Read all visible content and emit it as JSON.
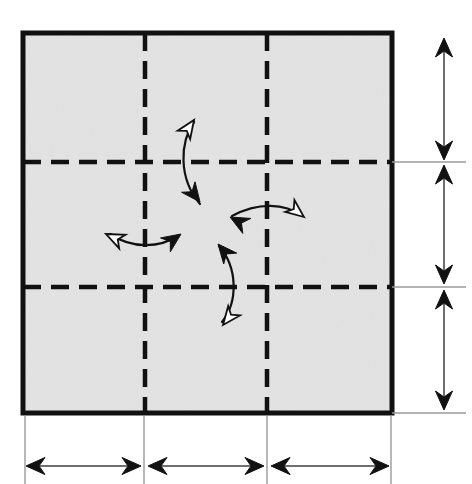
{
  "figure": {
    "type": "technical-diagram",
    "background_color": "#ffffff"
  },
  "colors": {
    "panel_fill": "#e3e3e3",
    "border_stroke": "#111111",
    "dashed_stroke": "#111111",
    "extension_line": "#9a9a9a",
    "arrow_solid": "#111111",
    "arrow_hollow_fill": "#ffffff",
    "arrow_hollow_stroke": "#111111",
    "dimension_line": "#6f6f6f"
  },
  "square": {
    "name": "main-panel",
    "x": 23,
    "y": 33,
    "width": 369,
    "height": 380,
    "stroke_width": 5,
    "fill": "#e3e3e3"
  },
  "grid": {
    "dash_pattern": "18 10",
    "stroke_width": 4.5,
    "vertical_lines": [
      {
        "name": "grid-line-vertical-1",
        "x": 145,
        "y1": 33,
        "y2": 413
      },
      {
        "name": "grid-line-vertical-2",
        "x": 267,
        "y1": 33,
        "y2": 413
      }
    ],
    "horizontal_lines": [
      {
        "name": "grid-line-horizontal-1",
        "y": 162,
        "x1": 23,
        "x2": 392
      },
      {
        "name": "grid-line-horizontal-2",
        "y": 287,
        "x1": 23,
        "x2": 392
      }
    ]
  },
  "rotation_arrows": [
    {
      "name": "rotation-arrow-top",
      "description": "curved double-headed arrow above center, hollow head points up, solid head points down",
      "path": "M 200 204 C 178 178 180 142 194 122",
      "head_start": {
        "style": "solid",
        "cx": 200,
        "cy": 202,
        "angle": 52
      },
      "head_end": {
        "style": "hollow",
        "cx": 194,
        "cy": 120,
        "angle": -56
      }
    },
    {
      "name": "rotation-arrow-right",
      "description": "curved double-headed arrow right of center, solid head points left, hollow head points right",
      "path": "M 232 216 C 258 202 285 203 302 216",
      "head_start": {
        "style": "solid",
        "cx": 230,
        "cy": 217,
        "angle": 208
      },
      "head_end": {
        "style": "hollow",
        "cx": 304,
        "cy": 217,
        "angle": 38
      }
    },
    {
      "name": "rotation-arrow-bottom",
      "description": "curved double-headed arrow below center, solid head points up, hollow head points down",
      "path": "M 219 246 C 238 268 238 302 222 322",
      "head_start": {
        "style": "solid",
        "cx": 218,
        "cy": 244,
        "angle": -130
      },
      "head_end": {
        "style": "hollow",
        "cx": 223,
        "cy": 325,
        "angle": 128
      }
    },
    {
      "name": "rotation-arrow-left",
      "description": "curved double-headed arrow left of center, hollow head points left, solid head points right",
      "path": "M 110 234 C 132 249 160 248 177 236",
      "head_start": {
        "style": "hollow",
        "cx": 106,
        "cy": 234,
        "angle": 205
      },
      "head_end": {
        "style": "solid",
        "cx": 181,
        "cy": 234,
        "angle": -35
      }
    }
  ],
  "vertical_dimensions": {
    "name": "vertical-dimension-stack",
    "axis_x": 444,
    "segments": [
      {
        "name": "vertical-dimension-segment-1",
        "y_top": 38,
        "y_bottom": 160,
        "label": ""
      },
      {
        "name": "vertical-dimension-segment-2",
        "y_top": 165,
        "y_bottom": 284,
        "label": ""
      },
      {
        "name": "vertical-dimension-segment-3",
        "y_top": 290,
        "y_bottom": 410,
        "label": ""
      }
    ],
    "extension_lines": [
      {
        "name": "vertical-extension-line-top",
        "y": 162,
        "x1": 392,
        "x2": 466
      },
      {
        "name": "vertical-extension-line-middle",
        "y": 287,
        "x1": 392,
        "x2": 466
      },
      {
        "name": "vertical-extension-line-bottom",
        "y": 413,
        "x1": 392,
        "x2": 466
      }
    ]
  },
  "horizontal_dimensions": {
    "name": "horizontal-dimension-stack",
    "axis_y": 466,
    "segments": [
      {
        "name": "horizontal-dimension-segment-1",
        "x_left": 26,
        "x_right": 141,
        "label": ""
      },
      {
        "name": "horizontal-dimension-segment-2",
        "x_left": 148,
        "x_right": 264,
        "label": ""
      },
      {
        "name": "horizontal-dimension-segment-3",
        "x_left": 271,
        "x_right": 389,
        "label": ""
      }
    ],
    "extension_lines": [
      {
        "name": "horizontal-extension-line-left",
        "x": 25,
        "y1": 416,
        "y2": 484
      },
      {
        "name": "horizontal-extension-line-mid1",
        "x": 144,
        "y1": 416,
        "y2": 484
      },
      {
        "name": "horizontal-extension-line-mid2",
        "x": 267,
        "y1": 416,
        "y2": 484
      },
      {
        "name": "horizontal-extension-line-right",
        "x": 391,
        "y1": 416,
        "y2": 484
      }
    ]
  }
}
